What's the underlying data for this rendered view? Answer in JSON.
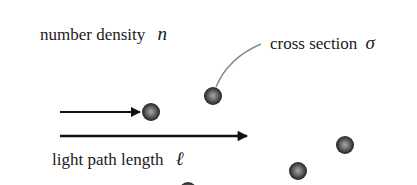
{
  "labels": {
    "number_density": {
      "text": "number density",
      "symbol": "n"
    },
    "cross_section": {
      "text": "cross section",
      "symbol": "σ"
    },
    "light_path_length": {
      "text": "light path length",
      "symbol": "ℓ"
    }
  },
  "arrows": [
    {
      "name": "incident-light-arrow",
      "x1": 60,
      "x2": 140,
      "y": 112
    },
    {
      "name": "path-length-arrow",
      "x1": 60,
      "x2": 247,
      "y": 136
    }
  ],
  "particles": [
    {
      "cx": 151,
      "cy": 112,
      "r": 9
    },
    {
      "cx": 213,
      "cy": 96,
      "r": 9
    },
    {
      "cx": 345,
      "cy": 145,
      "r": 9
    },
    {
      "cx": 298,
      "cy": 171,
      "r": 9
    },
    {
      "cx": 188,
      "cy": 190,
      "r": 9
    }
  ],
  "colors": {
    "text": "#1a1a1a",
    "arrow": "#111111",
    "leader_line": "#8a8a8a",
    "particle_light": "#9a9a9a",
    "particle_dark": "#1e1e1e"
  }
}
